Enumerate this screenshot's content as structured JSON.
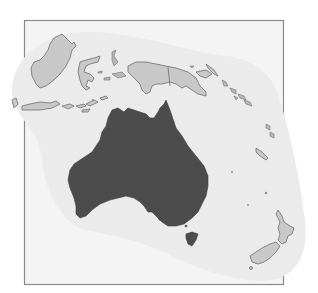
{
  "map": {
    "type": "locator-map",
    "region": "Oceania",
    "highlighted_country": "Australia",
    "colors": {
      "background": "#ffffff",
      "frame_fill": "#f4f4f4",
      "frame_border": "#8a8a8a",
      "halo": "#ebebeb",
      "highlight": "#4c4c4c",
      "other_land": "#c8c8c8",
      "coastline": "#6e6e6e"
    },
    "features": [
      {
        "name": "australia",
        "role": "highlighted"
      },
      {
        "name": "tasmania",
        "role": "highlighted"
      },
      {
        "name": "borneo",
        "role": "context"
      },
      {
        "name": "sulawesi",
        "role": "context"
      },
      {
        "name": "lesser-sunda-islands",
        "role": "context"
      },
      {
        "name": "new-guinea",
        "role": "context"
      },
      {
        "name": "solomon-islands",
        "role": "context"
      },
      {
        "name": "vanuatu",
        "role": "context"
      },
      {
        "name": "new-caledonia",
        "role": "context"
      },
      {
        "name": "new-zealand",
        "role": "context"
      }
    ]
  }
}
